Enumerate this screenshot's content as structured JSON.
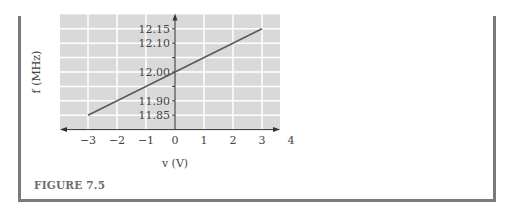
{
  "chart_data": {
    "type": "line",
    "title": "",
    "xlabel": "v (V)",
    "ylabel": "f (MHz)",
    "x_ticks": [
      "−3",
      "−2",
      "−1",
      "0",
      "1",
      "2",
      "3",
      "4"
    ],
    "y_ticks": [
      "11.85",
      "11.90",
      "12.00",
      "12.10",
      "12.15"
    ],
    "xlim": [
      -4,
      3.6
    ],
    "ylim": [
      11.8,
      12.2
    ],
    "grid": true,
    "series": [
      {
        "name": "f(v)",
        "x": [
          -3,
          3
        ],
        "y": [
          11.85,
          12.15
        ]
      }
    ]
  },
  "caption": "FIGURE 7.5",
  "colors": {
    "grid_background": "#d9d9d9",
    "grid_lines": "#ffffff",
    "line": "#5a5a5a",
    "axis": "#333333",
    "frame": "#7a7a7a"
  }
}
